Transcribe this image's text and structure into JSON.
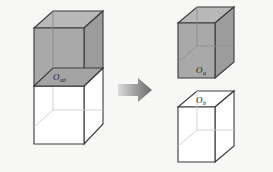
{
  "figure": {
    "type": "diagram",
    "background_color": "#f7f7f6",
    "operator": {
      "name": "rightwards-arrow",
      "glyph": "arrow-right",
      "color_dark": "#6e6e6e",
      "color_light": "#d2d2d2"
    },
    "shapes": [
      {
        "id": "combined-box",
        "role": "source",
        "label_base": "O",
        "label_subscript": "ab",
        "label_full": "O_ab",
        "fill_front": "#a9a9a9",
        "fill_top": "#b8b8b8",
        "fill_side": "#9a9a9a",
        "fill_lower": "#ffffff",
        "stroke": "#3a3a3a",
        "position": "left",
        "note": "tall box; upper half shaded gray, lower half white"
      },
      {
        "id": "cube-a",
        "role": "result-upper",
        "label_base": "O",
        "label_subscript": "a",
        "label_full": "O_a",
        "fill_front": "#a9a9a9",
        "fill_top": "#b8b8b8",
        "fill_side": "#9a9a9a",
        "stroke": "#3a3a3a",
        "position": "top-right",
        "note": "fully shaded gray cube"
      },
      {
        "id": "cube-b",
        "role": "result-lower",
        "label_base": "O",
        "label_subscript": "b",
        "label_full": "O_b",
        "fill_front": "#ffffff",
        "fill_top": "#ffffff",
        "fill_side": "#ffffff",
        "stroke": "#3a3a3a",
        "position": "bottom-right",
        "note": "white unshaded cube"
      }
    ]
  }
}
